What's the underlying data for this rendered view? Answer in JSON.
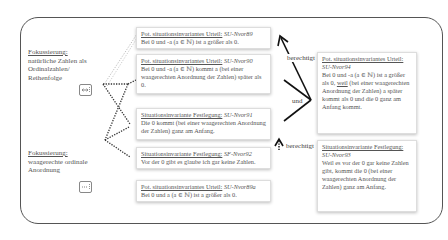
{
  "focus": [
    {
      "title": "Fokussierung:",
      "lines": [
        "natürliche Zahlen  als",
        "Ordinalzahlen/",
        "Reihenfolge"
      ],
      "icon": "horizontal-arrow-icon"
    },
    {
      "title": "Fokussierung:",
      "lines": [
        "waagerechte ordinale",
        "Anordnung"
      ],
      "icon": "dotted-line-icon"
    }
  ],
  "cards": [
    {
      "head": "Pot. situationsinvariantes Urteil:",
      "code": "SU-Nvor89",
      "text": "Bei 0 und -a (a ∈ ℕ) ist a größer als 0."
    },
    {
      "head": "Pot. situationsinvariantes Urteil:",
      "code": "SU-Nvor90",
      "text": "Bei 0 und -a (a ∈ ℕ) kommt a  (bei einer waagerechten Anordnung der Zahlen) später als 0."
    },
    {
      "head": "Situationsinvariante Festlegung:",
      "code": "SU-Nvor91",
      "text": "Die 0 kommt (bei einer waagerechten Anordnung der Zahlen)  ganz am Anfang."
    },
    {
      "head": "Situationsinvariante Festlegung:",
      "code": "SF-Nvor92",
      "text": "Vor der 0 gibt es glaube ich gar keine Zahlen."
    },
    {
      "head": "Pot. situationsinvariantes Urteil:",
      "code": "SU-Nvor89a",
      "text": "Bei 0 und a (a ∈ ℕ) ist a größer als 0."
    }
  ],
  "right_cards": [
    {
      "head": "Pot. situationsinvariantes Urteil:",
      "code": "SU-Nvor94",
      "text_pre": "Bei 0 und -a (a ∈ ℕ) ist a größer als 0, ",
      "weil": "weil",
      "text_post": " (bei einer waagerechten Anordnung der Zahlen) a später kommt als 0 und die 0 ganz am Anfang kommt."
    },
    {
      "head": "Situationsinvariante Festlegung:",
      "code": "SU-Nvor93",
      "text": "Weil es vor der 0 gar keine Zahlen gibt, kommt die 0 (bei einer waagerechten Anordnung der Zahlen)  ganz am Anfang."
    }
  ],
  "labels": {
    "berechtigt_top": "berechtigt",
    "und": "und",
    "berechtigt_bottom": "berechtigt"
  }
}
